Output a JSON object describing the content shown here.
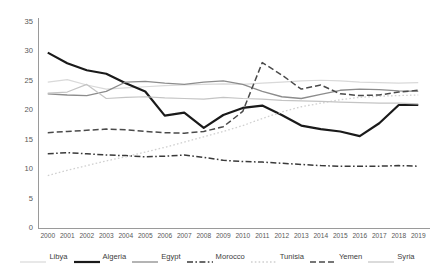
{
  "chart_data": {
    "type": "line",
    "title": "",
    "xlabel": "",
    "ylabel": "",
    "ylim": [
      0,
      35
    ],
    "ytick_step": 5,
    "yticks": [
      "35",
      "30",
      "25",
      "20",
      "15",
      "10",
      "5",
      "0"
    ],
    "grid": false,
    "legend_position": "bottom",
    "categories": [
      "2000",
      "2001",
      "2002",
      "2003",
      "2004",
      "2005",
      "2006",
      "2007",
      "2008",
      "2009",
      "2010",
      "2011",
      "2012",
      "2013",
      "2014",
      "2015",
      "2016",
      "2017",
      "2018",
      "2019"
    ],
    "series": [
      {
        "name": "Libya",
        "color": "#d9d9d9",
        "style": "solid",
        "width": 1.2,
        "values": [
          24.8,
          25.2,
          24.3,
          23.6,
          23.8,
          24.0,
          24.2,
          24.3,
          24.4,
          24.5,
          24.4,
          24.6,
          24.8,
          25.0,
          25.1,
          25.0,
          24.8,
          24.7,
          24.6,
          24.7
        ]
      },
      {
        "name": "Algeria",
        "color": "#1a1a1a",
        "style": "solid",
        "width": 2.2,
        "values": [
          29.8,
          28.0,
          26.8,
          26.2,
          24.6,
          23.2,
          19.1,
          19.6,
          17.0,
          19.2,
          20.4,
          20.8,
          19.2,
          17.4,
          16.8,
          16.4,
          15.6,
          17.8,
          20.9,
          20.9
        ]
      },
      {
        "name": "Egypt",
        "color": "#8c8c8c",
        "style": "solid",
        "width": 1.3,
        "values": [
          22.8,
          22.6,
          22.5,
          23.2,
          24.8,
          24.9,
          24.6,
          24.4,
          24.8,
          25.0,
          24.4,
          23.2,
          22.3,
          22.0,
          22.7,
          23.4,
          23.6,
          23.5,
          23.3,
          23.2
        ]
      },
      {
        "name": "Morocco",
        "color": "#3a3a3a",
        "style": "dashdot",
        "width": 1.5,
        "values": [
          12.6,
          12.8,
          12.6,
          12.4,
          12.3,
          12.1,
          12.2,
          12.4,
          12.0,
          11.5,
          11.3,
          11.2,
          11.0,
          10.8,
          10.6,
          10.5,
          10.5,
          10.5,
          10.6,
          10.5
        ]
      },
      {
        "name": "Tunisia",
        "color": "#d0d0d0",
        "style": "dotted",
        "width": 1.3,
        "values": [
          8.9,
          9.8,
          10.6,
          11.4,
          12.1,
          12.9,
          13.7,
          14.6,
          15.5,
          16.4,
          17.4,
          18.6,
          19.7,
          20.6,
          21.2,
          21.8,
          22.2,
          22.4,
          22.5,
          22.6
        ]
      },
      {
        "name": "Yemen",
        "color": "#4a4a4a",
        "style": "dashed",
        "width": 1.5,
        "values": [
          16.2,
          16.4,
          16.6,
          16.8,
          16.7,
          16.4,
          16.2,
          16.1,
          16.4,
          17.2,
          19.8,
          28.1,
          26.0,
          23.6,
          24.3,
          22.8,
          22.5,
          22.6,
          23.1,
          23.4
        ]
      },
      {
        "name": "Syria",
        "color": "#c4c4c4",
        "style": "solid",
        "width": 1.2,
        "values": [
          22.9,
          23.1,
          24.4,
          22.0,
          22.2,
          22.3,
          22.1,
          22.0,
          21.9,
          22.2,
          22.0,
          21.9,
          21.7,
          21.6,
          21.5,
          21.4,
          21.3,
          21.2,
          21.2,
          21.1
        ]
      }
    ]
  }
}
